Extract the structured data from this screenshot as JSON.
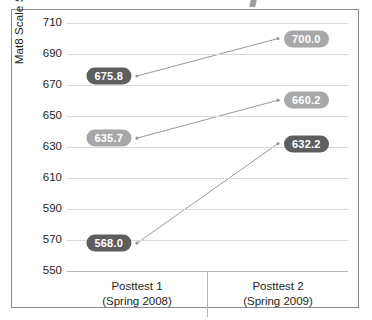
{
  "chart_data": {
    "type": "line",
    "title": "",
    "xlabel": "",
    "ylabel": "Mat8 Scale Score",
    "categories": [
      "Posttest 1\n(Spring 2008)",
      "Posttest 2\n(Spring 2009)"
    ],
    "category_lines": [
      {
        "line1": "Posttest 1",
        "line2": "(Spring 2008)"
      },
      {
        "line1": "Posttest 2",
        "line2": "(Spring 2009)"
      }
    ],
    "ylim": [
      550,
      710
    ],
    "ytick_step": 20,
    "yticks": [
      710,
      690,
      670,
      650,
      630,
      610,
      590,
      570,
      550
    ],
    "ytick_labels": [
      "710",
      "690",
      "670",
      "650",
      "630",
      "610",
      "590",
      "570",
      "550"
    ],
    "grid": true,
    "legend": "none",
    "series": [
      {
        "name": "series-1",
        "values": [
          675.8,
          700.0
        ],
        "labels": [
          "675.8",
          "700.0"
        ],
        "label_styles": [
          "dark",
          "light"
        ]
      },
      {
        "name": "series-2",
        "values": [
          635.7,
          660.2
        ],
        "labels": [
          "635.7",
          "660.2"
        ],
        "label_styles": [
          "light",
          "light"
        ]
      },
      {
        "name": "series-3",
        "values": [
          568.0,
          632.2
        ],
        "labels": [
          "568.0",
          "632.2"
        ],
        "label_styles": [
          "dark",
          "dark"
        ]
      }
    ],
    "colors": {
      "line": "#9a9a9a",
      "grid": "#d9d9d9",
      "axis": "#b5b5b5",
      "badge_dark": "#5e5e5e",
      "badge_light": "#a8a8a8",
      "text": "#231f20",
      "border": "#8a8a8a"
    }
  }
}
